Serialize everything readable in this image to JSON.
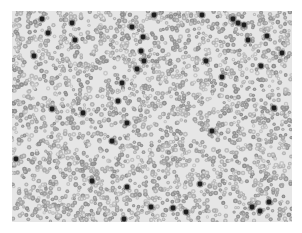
{
  "image": {
    "subject": "blood smear micrograph",
    "mode": "grayscale",
    "width": 302,
    "height": 233,
    "content_region": {
      "x": 12,
      "y": 11,
      "width": 280,
      "height": 211
    },
    "background_color": "#ffffff",
    "field_color": "#e6e6e6",
    "cell_color": "#a8a8a8",
    "nucleus_color": "#1e1e1e"
  },
  "dark_cells": [
    [
      30,
      8
    ],
    [
      36,
      22
    ],
    [
      63,
      29
    ],
    [
      22,
      45
    ],
    [
      120,
      16
    ],
    [
      142,
      4
    ],
    [
      131,
      26
    ],
    [
      129,
      40
    ],
    [
      132,
      50
    ],
    [
      125,
      58
    ],
    [
      110,
      72
    ],
    [
      106,
      90
    ],
    [
      115,
      112
    ],
    [
      100,
      130
    ],
    [
      80,
      170
    ],
    [
      71,
      102
    ],
    [
      40,
      98
    ],
    [
      4,
      148
    ],
    [
      60,
      12
    ],
    [
      190,
      4
    ],
    [
      221,
      8
    ],
    [
      232,
      14
    ],
    [
      236,
      29
    ],
    [
      270,
      42
    ],
    [
      255,
      25
    ],
    [
      194,
      50
    ],
    [
      210,
      66
    ],
    [
      249,
      55
    ],
    [
      262,
      97
    ],
    [
      200,
      120
    ],
    [
      226,
      12
    ],
    [
      188,
      173
    ],
    [
      139,
      196
    ],
    [
      161,
      197
    ],
    [
      174,
      201
    ],
    [
      240,
      196
    ],
    [
      257,
      191
    ],
    [
      248,
      200
    ],
    [
      115,
      176
    ],
    [
      112,
      208
    ]
  ]
}
